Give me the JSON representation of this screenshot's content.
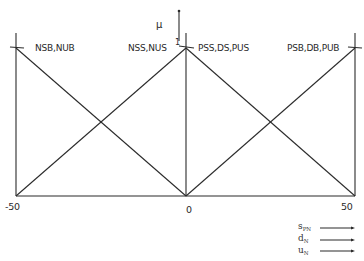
{
  "diagram": {
    "axis_label": "μ",
    "peak_label": "1",
    "membership_functions": [
      {
        "label": "NSB,NUB",
        "shape": "left-shoulder",
        "points": [
          [
            -50,
            1
          ],
          [
            0,
            0
          ]
        ]
      },
      {
        "label": "NSS,NUS",
        "shape": "triangle",
        "points": [
          [
            -50,
            0
          ],
          [
            0,
            1
          ],
          [
            50,
            0
          ]
        ]
      },
      {
        "label": "PSS,DS,PUS",
        "shape": "triangle",
        "points": [
          [
            -50,
            0
          ],
          [
            0,
            1
          ],
          [
            50,
            0
          ]
        ]
      },
      {
        "label": "PSB,DB,PUB",
        "shape": "right-shoulder",
        "points": [
          [
            0,
            0
          ],
          [
            50,
            1
          ]
        ]
      }
    ],
    "x_ticks": [
      "-50",
      "0",
      "50"
    ],
    "legend": [
      {
        "symbol": "s",
        "subscript": "PN"
      },
      {
        "symbol": "d",
        "subscript": "N"
      },
      {
        "symbol": "u",
        "subscript": "N"
      }
    ],
    "line_color": "#2b2b2b"
  }
}
